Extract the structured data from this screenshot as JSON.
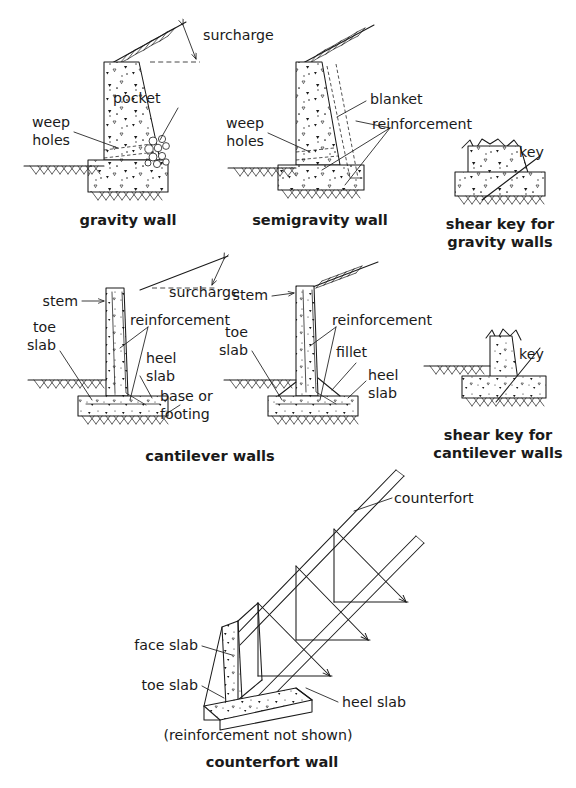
{
  "figure": {
    "background_color": "#ffffff",
    "ink_color": "#1a1a1a"
  },
  "panels": [
    {
      "id": "gravity-wall",
      "caption": "gravity wall",
      "labels": [
        {
          "id": "surcharge",
          "text": "surcharge"
        },
        {
          "id": "pocket",
          "text": "pocket"
        },
        {
          "id": "weep-holes-1",
          "text": "weep"
        },
        {
          "id": "weep-holes-2",
          "text": "holes"
        }
      ]
    },
    {
      "id": "semigravity-wall",
      "caption": "semigravity wall",
      "labels": [
        {
          "id": "blanket",
          "text": "blanket"
        },
        {
          "id": "reinforcement",
          "text": "reinforcement"
        },
        {
          "id": "weep-holes-1",
          "text": "weep"
        },
        {
          "id": "weep-holes-2",
          "text": "holes"
        }
      ]
    },
    {
      "id": "shear-key-gravity",
      "caption_line1": "shear key for",
      "caption_line2": "gravity walls",
      "labels": [
        {
          "id": "key",
          "text": "key"
        }
      ]
    },
    {
      "id": "cantilever-wall-left",
      "caption": "cantilever walls",
      "labels": [
        {
          "id": "surcharge",
          "text": "surcharge"
        },
        {
          "id": "stem",
          "text": "stem"
        },
        {
          "id": "reinforcement",
          "text": "reinforcement"
        },
        {
          "id": "toe-slab-1",
          "text": "toe"
        },
        {
          "id": "toe-slab-2",
          "text": "slab"
        },
        {
          "id": "heel-slab-1",
          "text": "heel"
        },
        {
          "id": "heel-slab-2",
          "text": "slab"
        },
        {
          "id": "base-1",
          "text": "base or"
        },
        {
          "id": "base-2",
          "text": "footing"
        }
      ]
    },
    {
      "id": "cantilever-wall-right",
      "labels": [
        {
          "id": "stem",
          "text": "stem"
        },
        {
          "id": "reinforcement",
          "text": "reinforcement"
        },
        {
          "id": "toe-slab-1",
          "text": "toe"
        },
        {
          "id": "toe-slab-2",
          "text": "slab"
        },
        {
          "id": "fillet",
          "text": "fillet"
        },
        {
          "id": "heel-slab-1",
          "text": "heel"
        },
        {
          "id": "heel-slab-2",
          "text": "slab"
        }
      ]
    },
    {
      "id": "shear-key-cantilever",
      "caption_line1": "shear key for",
      "caption_line2": "cantilever walls",
      "labels": [
        {
          "id": "key",
          "text": "key"
        }
      ]
    },
    {
      "id": "counterfort-wall",
      "caption": "counterfort wall",
      "note": "(reinforcement not shown)",
      "labels": [
        {
          "id": "counterfort",
          "text": "counterfort"
        },
        {
          "id": "face-slab",
          "text": "face slab"
        },
        {
          "id": "toe-slab",
          "text": "toe slab"
        },
        {
          "id": "heel-slab",
          "text": "heel slab"
        }
      ]
    }
  ]
}
